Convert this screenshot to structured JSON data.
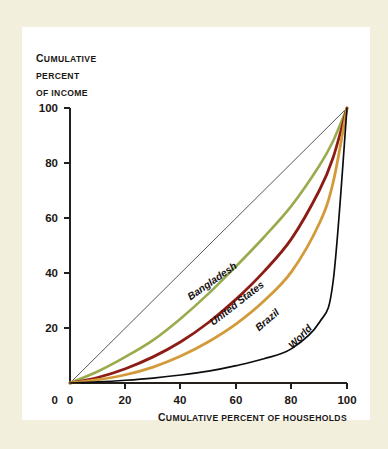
{
  "figure": {
    "background_color": "#f2efdc",
    "card_color": "#ffffff",
    "axis_color": "#231f1c"
  },
  "chart_data": {
    "type": "line",
    "title": "",
    "subtitle": "",
    "xlabel": "Cumulative percent of households",
    "ylabel": "Cumulative percent of income",
    "xlim": [
      0,
      100
    ],
    "ylim": [
      0,
      100
    ],
    "grid": false,
    "legend_position": "inline-curve-labels",
    "x_ticks": [
      0,
      20,
      40,
      60,
      80,
      100
    ],
    "y_ticks": [
      0,
      20,
      40,
      60,
      80,
      100
    ],
    "x_tick_labels": [
      "0",
      "20",
      "40",
      "60",
      "80",
      "100"
    ],
    "y_tick_labels": [
      "0",
      "20",
      "40",
      "60",
      "80",
      "100"
    ],
    "x": [
      0,
      10,
      20,
      30,
      40,
      50,
      60,
      70,
      80,
      90,
      95,
      100
    ],
    "series": [
      {
        "name": "Line of equality",
        "color": "#2b2b33",
        "width": 0.8,
        "values": [
          0,
          10,
          20,
          30,
          40,
          50,
          60,
          70,
          80,
          90,
          95,
          100
        ],
        "labeled": false
      },
      {
        "name": "Bangladesh",
        "color": "#9aab4e",
        "width": 2.6,
        "values": [
          0,
          4.2,
          9.5,
          15.6,
          23.5,
          32.5,
          42.5,
          53.0,
          64.5,
          79.0,
          88.0,
          100
        ],
        "labeled": true,
        "label_x": 52,
        "label_y": 36,
        "label_rotation": -35
      },
      {
        "name": "United States",
        "color": "#8e1c16",
        "width": 2.8,
        "values": [
          0,
          2.0,
          5.2,
          9.5,
          15.0,
          22.0,
          30.5,
          40.5,
          52.5,
          70.0,
          82.0,
          100
        ],
        "labeled": true,
        "label_x": 61,
        "label_y": 28,
        "label_rotation": -38
      },
      {
        "name": "Brazil",
        "color": "#d39a3a",
        "width": 2.8,
        "values": [
          0,
          1.2,
          3.0,
          5.8,
          9.8,
          15.0,
          21.5,
          29.8,
          40.5,
          58.0,
          73.0,
          100
        ],
        "labeled": true,
        "label_x": 72,
        "label_y": 22,
        "label_rotation": -41
      },
      {
        "name": "World",
        "color": "#0d0d0d",
        "width": 1.7,
        "values": [
          0,
          0.4,
          1.0,
          1.8,
          2.9,
          4.3,
          6.3,
          8.8,
          12.5,
          22.0,
          37.0,
          100
        ],
        "labeled": true,
        "label_x": 84,
        "label_y": 16,
        "label_rotation": -46
      }
    ]
  },
  "axis_titles": {
    "y_line_1_cap": "C",
    "y_line_1_rest": "UMULATIVE",
    "y_line_2": "PERCENT",
    "y_line_3": "OF INCOME",
    "x_cap": "C",
    "x_rest": "UMULATIVE PERCENT OF HOUSEHOLDS"
  }
}
